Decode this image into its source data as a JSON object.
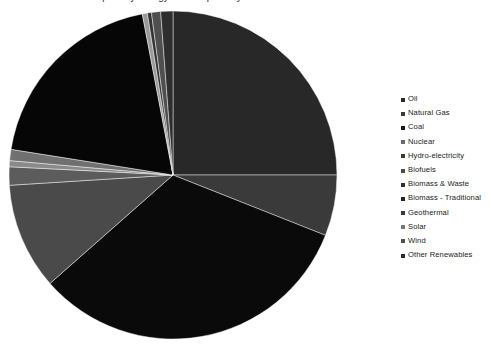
{
  "chart_data": {
    "type": "pie",
    "title": "Global primary energy consumption by source",
    "legend_position": "right",
    "start_angle_deg": 0,
    "direction": "clockwise",
    "center": {
      "x": 173,
      "y": 175
    },
    "radius": 164,
    "categories": [
      "Oil",
      "Natural Gas",
      "Coal",
      "Nuclear",
      "Hydro-electricity",
      "Biofuels",
      "Biomass & Waste",
      "Biomass - Traditional",
      "Geothermal",
      "Solar",
      "Wind",
      "Other Renewables"
    ],
    "values": [
      25.0,
      6.0,
      32.5,
      10.5,
      1.8,
      0.6,
      1.1,
      19.5,
      0.5,
      0.4,
      0.9,
      1.2
    ],
    "colors": [
      "#282828",
      "#3a3a3a",
      "#0a0a0a",
      "#4a4a4a",
      "#5c5c5c",
      "#8a8a8a",
      "#707070",
      "#060606",
      "#9a9a9a",
      "#343434",
      "#4f4f4f",
      "#2e2e2e"
    ],
    "xlabel": "",
    "ylabel": ""
  },
  "legend": {
    "items": [
      {
        "label": "Oil",
        "color": "#282828"
      },
      {
        "label": "Natural Gas",
        "color": "#3a3a3a"
      },
      {
        "label": "Coal",
        "color": "#1b1b1b"
      },
      {
        "label": "Nuclear",
        "color": "#6b6b6b"
      },
      {
        "label": "Hydro-electricity",
        "color": "#3c3c3c"
      },
      {
        "label": "Biofuels",
        "color": "#4a4a4a"
      },
      {
        "label": "Biomass & Waste",
        "color": "#2f2f2f"
      },
      {
        "label": "Biomass - Traditional",
        "color": "#222222"
      },
      {
        "label": "Geothermal",
        "color": "#3a3a3a"
      },
      {
        "label": "Solar",
        "color": "#777777"
      },
      {
        "label": "Wind",
        "color": "#4f4f4f"
      },
      {
        "label": "Other Renewables",
        "color": "#2b2b2b"
      }
    ]
  }
}
